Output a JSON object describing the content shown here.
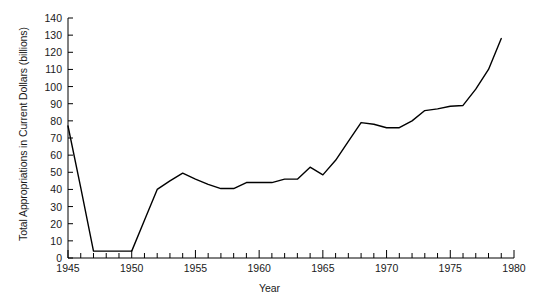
{
  "chart_data": {
    "type": "line",
    "title": "",
    "xlabel": "Year",
    "ylabel": "Total Appropriations in Current Dollars (billions)",
    "xlim": [
      1945,
      1980
    ],
    "ylim": [
      0,
      140
    ],
    "grid": false,
    "legend": null,
    "x_tick_labels": [
      "1945",
      "1950",
      "1955",
      "1960",
      "1965",
      "1970",
      "1975",
      "1980"
    ],
    "x_tick_values": [
      1945,
      1950,
      1955,
      1960,
      1965,
      1970,
      1975,
      1980
    ],
    "x_minor_tick_step": 1,
    "y_tick_labels": [
      "0",
      "10",
      "20",
      "30",
      "40",
      "50",
      "60",
      "70",
      "80",
      "90",
      "100",
      "110",
      "120",
      "130",
      "140"
    ],
    "y_tick_values": [
      0,
      10,
      20,
      30,
      40,
      50,
      60,
      70,
      80,
      90,
      100,
      110,
      120,
      130,
      140
    ],
    "line_color": "#000000",
    "line_width": 1.4,
    "x": [
      1945,
      1946,
      1947,
      1948,
      1949,
      1950,
      1951,
      1952,
      1953,
      1954,
      1955,
      1956,
      1957,
      1958,
      1959,
      1960,
      1961,
      1962,
      1963,
      1964,
      1965,
      1966,
      1967,
      1968,
      1969,
      1970,
      1971,
      1972,
      1973,
      1974,
      1975,
      1976,
      1977,
      1978,
      1979
    ],
    "y": [
      77,
      41,
      4,
      4,
      4,
      4,
      22,
      40,
      45,
      49.5,
      46,
      43,
      40.5,
      40.5,
      44,
      44,
      44,
      46,
      46,
      53,
      48.5,
      57,
      68,
      79,
      78,
      76,
      76,
      80,
      86,
      87,
      88.5,
      89,
      98.5,
      110,
      128
    ]
  },
  "axes": {
    "y_axis_title": "Total Appropriations in Current Dollars (billions)",
    "x_axis_title": "Year"
  }
}
